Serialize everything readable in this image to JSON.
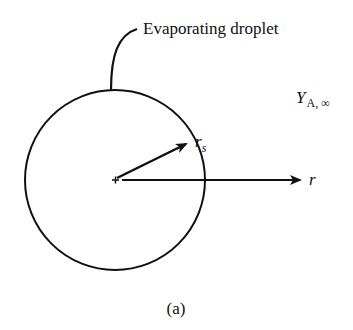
{
  "figure": {
    "caption": "(a)",
    "droplet_label": "Evaporating droplet",
    "far_field_label": {
      "symbol": "Y",
      "subscript": "A, ∞"
    },
    "surface_radius_label": {
      "symbol": "r",
      "subscript": "s"
    },
    "radial_axis_label": "r"
  },
  "colors": {
    "stroke": "#111111",
    "background": "#ffffff"
  }
}
